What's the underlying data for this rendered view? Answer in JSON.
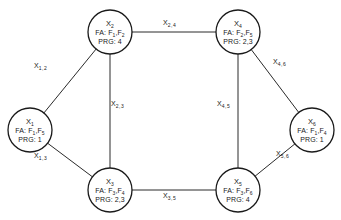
{
  "diagram": {
    "type": "network-graph",
    "nodes": [
      {
        "id": "X1",
        "var": "X",
        "sub": "1",
        "fa_label": "FA:",
        "fa": [
          {
            "var": "F",
            "sub": "1"
          },
          {
            "var": "F",
            "sub": "5"
          }
        ],
        "prg_label": "PRG:",
        "prg": "1",
        "x": 30,
        "y": 130
      },
      {
        "id": "X2",
        "var": "X",
        "sub": "2",
        "fa_label": "FA:",
        "fa": [
          {
            "var": "F",
            "sub": "1"
          },
          {
            "var": "F",
            "sub": "2"
          }
        ],
        "prg_label": "PRG:",
        "prg": "4",
        "x": 110,
        "y": 32
      },
      {
        "id": "X3",
        "var": "X",
        "sub": "3",
        "fa_label": "FA:",
        "fa": [
          {
            "var": "F",
            "sub": "3"
          },
          {
            "var": "F",
            "sub": "4"
          }
        ],
        "prg_label": "PRG:",
        "prg": "2,3",
        "x": 110,
        "y": 190
      },
      {
        "id": "X4",
        "var": "X",
        "sub": "4",
        "fa_label": "FA:",
        "fa": [
          {
            "var": "F",
            "sub": "2"
          },
          {
            "var": "F",
            "sub": "5"
          }
        ],
        "prg_label": "PRG:",
        "prg": "2,3",
        "x": 238,
        "y": 32
      },
      {
        "id": "X5",
        "var": "X",
        "sub": "5",
        "fa_label": "FA:",
        "fa": [
          {
            "var": "F",
            "sub": "3"
          },
          {
            "var": "F",
            "sub": "6"
          }
        ],
        "prg_label": "PRG:",
        "prg": "4",
        "x": 238,
        "y": 190
      },
      {
        "id": "X6",
        "var": "X",
        "sub": "6",
        "fa_label": "FA:",
        "fa": [
          {
            "var": "F",
            "sub": "1"
          },
          {
            "var": "F",
            "sub": "4"
          }
        ],
        "prg_label": "PRG:",
        "prg": "1",
        "x": 312,
        "y": 130
      }
    ],
    "edges": [
      {
        "from": "X1",
        "to": "X2",
        "var": "X",
        "sub": "1,2",
        "lx": 34,
        "ly": 62
      },
      {
        "from": "X1",
        "to": "X3",
        "var": "X",
        "sub": "1,3",
        "lx": 34,
        "ly": 152
      },
      {
        "from": "X2",
        "to": "X3",
        "var": "X",
        "sub": "2,3",
        "lx": 111,
        "ly": 100
      },
      {
        "from": "X2",
        "to": "X4",
        "var": "X",
        "sub": "2,4",
        "lx": 163,
        "ly": 19
      },
      {
        "from": "X3",
        "to": "X5",
        "var": "X",
        "sub": "3,5",
        "lx": 163,
        "ly": 192
      },
      {
        "from": "X4",
        "to": "X5",
        "var": "X",
        "sub": "4,5",
        "lx": 217,
        "ly": 100
      },
      {
        "from": "X4",
        "to": "X6",
        "var": "X",
        "sub": "4,6",
        "lx": 273,
        "ly": 58
      },
      {
        "from": "X5",
        "to": "X6",
        "var": "X",
        "sub": "5,6",
        "lx": 276,
        "ly": 150
      }
    ],
    "colors": {
      "stroke": "#1a1a1a",
      "background": "#ffffff"
    }
  }
}
